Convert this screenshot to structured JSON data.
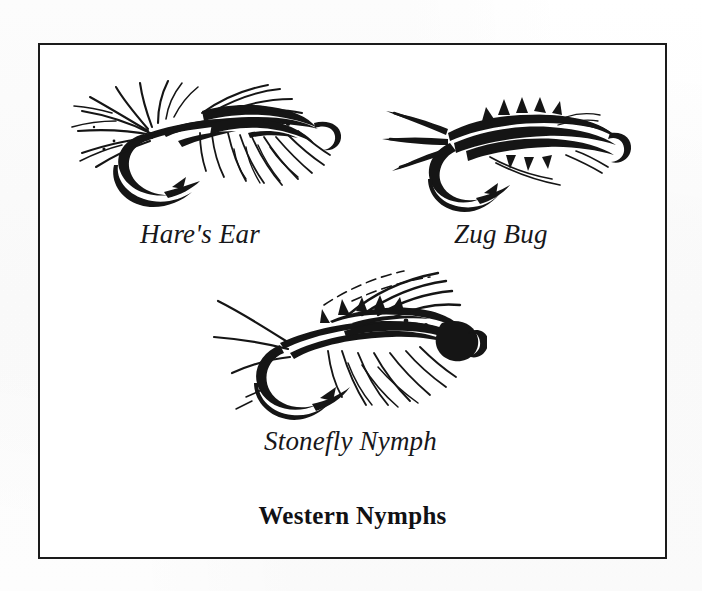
{
  "page": {
    "background_color": "#fdfdfd",
    "ink_color": "#151515",
    "frame_color": "#1b1b1b"
  },
  "plate": {
    "title": "Western Nymphs",
    "frame": {
      "border_width_px": 2.5,
      "border_style": "solid"
    },
    "figures": [
      {
        "id": "hares-ear",
        "caption": "Hare's Ear",
        "icon": "nymph-fly-illustration",
        "description": "Hare's Ear nymph fly tied on a curved wet-fly hook, shaggy dubbed body with flared guard-hair fibers and a soft hackle collar",
        "position": "top-left"
      },
      {
        "id": "zug-bug",
        "caption": "Zug Bug",
        "icon": "nymph-fly-illustration",
        "description": "Zug Bug nymph fly with peacock herl body, split tail fibers and a folded wing case over the thorax",
        "position": "top-right"
      },
      {
        "id": "stonefly-nymph",
        "caption": "Stonefly Nymph",
        "icon": "nymph-fly-illustration",
        "description": "Stonefly Nymph fly with long paired antennae and tails, segmented abdomen, splayed legs and a pronounced bead head",
        "position": "bottom-center"
      }
    ]
  }
}
